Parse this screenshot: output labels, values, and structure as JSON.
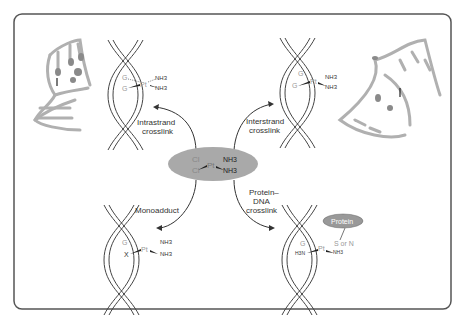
{
  "diagram": {
    "center": {
      "ligands_left": [
        "Cl",
        "Cl"
      ],
      "metal": "Pt",
      "ligands_right": [
        "NH3",
        "NH3"
      ],
      "fill": "#a9a9a9"
    },
    "adducts": [
      {
        "id": "intrastrand",
        "label_line1": "Intrastrand",
        "label_line2": "crosslink",
        "left_top": "G",
        "left_bottom": "G",
        "metal": "Pt",
        "right_top": "NH3",
        "right_bottom": "NH3"
      },
      {
        "id": "interstrand",
        "label_line1": "Interstrand",
        "label_line2": "crosslink",
        "left_top": "G",
        "left_bottom": "G",
        "metal": "Pt",
        "right_top": "NH3",
        "right_bottom": "NH3"
      },
      {
        "id": "monoadduct",
        "label_line1": "Monoadduct",
        "left_top": "G",
        "left_bottom": "X",
        "metal": "Pt",
        "right_top": "NH3",
        "right_bottom": "NH3"
      },
      {
        "id": "protein-dna",
        "label_line1": "Protein–",
        "label_line2": "DNA",
        "label_line3": "crosslink",
        "left_top": "G",
        "left_bottom": "H3N",
        "metal": "Pt",
        "right_top": "S or N",
        "right_bottom": "NH3",
        "protein_label": "Protein"
      }
    ],
    "colors": {
      "border": "#555555",
      "ink": "#333333",
      "gray_text": "#999999",
      "rna": "#b0b0b0",
      "rna_dark": "#8a8a8a"
    }
  }
}
